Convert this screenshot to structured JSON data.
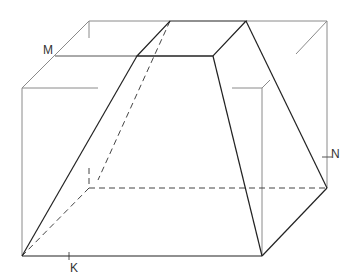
{
  "figure": {
    "labels": {
      "M": "M",
      "N": "N",
      "K": "K"
    },
    "colors": {
      "solid_edge": "#222222",
      "box_edge": "#888888",
      "hidden_edge": "#444444",
      "background": "#ffffff"
    }
  }
}
